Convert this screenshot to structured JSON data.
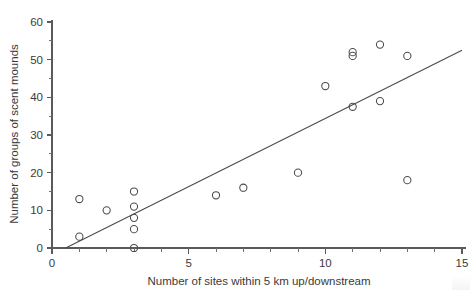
{
  "chart_data": {
    "type": "scatter",
    "title": "",
    "subtitle": "",
    "xlabel": "Number of sites within 5 km up/downstream",
    "ylabel": "Number of groups of scent mounds",
    "xlim": [
      0,
      15
    ],
    "ylim": [
      0,
      60
    ],
    "x_major_ticks": [
      0,
      5,
      10,
      15
    ],
    "x_major_tick_labels": [
      "0",
      "5",
      "10",
      "15"
    ],
    "x_minor_tick_step": 1,
    "y_major_ticks": [
      0,
      10,
      20,
      30,
      40,
      50,
      60
    ],
    "y_major_tick_labels": [
      "0",
      "10",
      "20",
      "30",
      "40",
      "50",
      "60"
    ],
    "y_minor_tick_step": 5,
    "grid": false,
    "legend": null,
    "marker": "open-circle",
    "marker_color": "#4a4a4a",
    "points": [
      {
        "x": 1,
        "y": 13
      },
      {
        "x": 1,
        "y": 3
      },
      {
        "x": 2,
        "y": 10
      },
      {
        "x": 3,
        "y": 15
      },
      {
        "x": 3,
        "y": 11
      },
      {
        "x": 3,
        "y": 8
      },
      {
        "x": 3,
        "y": 5
      },
      {
        "x": 3,
        "y": 0
      },
      {
        "x": 6,
        "y": 14
      },
      {
        "x": 7,
        "y": 16
      },
      {
        "x": 9,
        "y": 20
      },
      {
        "x": 10,
        "y": 43
      },
      {
        "x": 11,
        "y": 52
      },
      {
        "x": 11,
        "y": 51
      },
      {
        "x": 11,
        "y": 37.5
      },
      {
        "x": 12,
        "y": 54
      },
      {
        "x": 12,
        "y": 39
      },
      {
        "x": 13,
        "y": 51
      },
      {
        "x": 13,
        "y": 18
      }
    ],
    "fit_line": {
      "name": "regression-line",
      "x_start": 0.5,
      "y_start": 0,
      "x_end": 15,
      "y_end": 52.5,
      "color": "#4a4a4a"
    }
  },
  "axes": {
    "x_axis_name": "x-axis",
    "y_axis_name": "y-axis"
  }
}
